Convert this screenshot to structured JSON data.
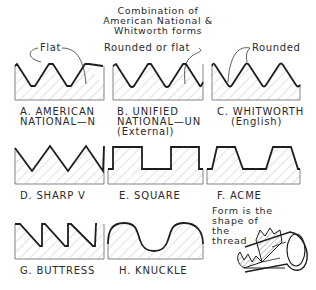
{
  "title": {
    "lines": [
      "Combination of",
      "American National &",
      "Whitworth forms"
    ]
  },
  "callouts": {
    "flat": "Flat",
    "rounded_or_flat": "Rounded or flat",
    "rounded": "Rounded"
  },
  "profiles": [
    {
      "id": "A",
      "caption_lines": [
        "A. AMERICAN",
        "NATIONAL—N"
      ],
      "form": "american-national"
    },
    {
      "id": "B",
      "caption_lines": [
        "B. UNIFIED",
        "NATIONAL—UN",
        "(External)"
      ],
      "form": "unified-national"
    },
    {
      "id": "C",
      "caption_lines": [
        "C. WHITWORTH",
        "(English)"
      ],
      "form": "whitworth"
    },
    {
      "id": "D",
      "caption_lines": [
        "D. SHARP V"
      ],
      "form": "sharp-v"
    },
    {
      "id": "E",
      "caption_lines": [
        "E. SQUARE"
      ],
      "form": "square"
    },
    {
      "id": "F",
      "caption_lines": [
        "F. ACME"
      ],
      "form": "acme"
    },
    {
      "id": "G",
      "caption_lines": [
        "G. BUTTRESS"
      ],
      "form": "buttress"
    },
    {
      "id": "H",
      "caption_lines": [
        "H. KNUCKLE"
      ],
      "form": "knuckle"
    }
  ],
  "note": {
    "lines": [
      "Form is the",
      "shape of",
      "the",
      "thread"
    ]
  },
  "colors": {
    "line": "#1e1e1e",
    "hatch": "#b4b4b4",
    "text": "#2a2a2a"
  }
}
